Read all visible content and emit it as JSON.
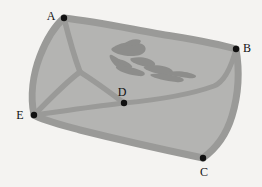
{
  "figure": {
    "name": "region-map-diagram",
    "width": 262,
    "height": 187,
    "background_color": "#f4f3f1",
    "fill_color": "#b4b4b2",
    "border_color": "#9a9a98",
    "edge_color": "#9a9a98",
    "blob_color": "#8d8d8b",
    "node_color": "#111111"
  },
  "vertices": [
    {
      "id": "A",
      "label": "A",
      "x": 64,
      "y": 18,
      "label_x": 51,
      "label_y": 16
    },
    {
      "id": "B",
      "label": "B",
      "x": 236,
      "y": 49,
      "label_x": 245,
      "label_y": 47
    },
    {
      "id": "C",
      "label": "C",
      "x": 203,
      "y": 158,
      "label_x": 202,
      "label_y": 175
    },
    {
      "id": "D",
      "label": "D",
      "x": 124,
      "y": 103,
      "label_x": 121,
      "label_y": 95
    },
    {
      "id": "E",
      "label": "E",
      "x": 34,
      "y": 115,
      "label_x": 19,
      "label_y": 118
    }
  ],
  "edges": [
    {
      "from": "A",
      "to": "B",
      "kind": "boundary"
    },
    {
      "from": "B",
      "to": "C",
      "kind": "boundary"
    },
    {
      "from": "C",
      "to": "E",
      "kind": "boundary"
    },
    {
      "from": "E",
      "to": "A",
      "kind": "boundary"
    },
    {
      "from": "A",
      "to": "D",
      "kind": "interior"
    },
    {
      "from": "E",
      "to": "D",
      "kind": "interior"
    },
    {
      "from": "D",
      "to": "B",
      "kind": "interior"
    },
    {
      "from": "A",
      "to": "E",
      "kind": "interior-branch"
    }
  ],
  "interior_feature": {
    "name": "interior-blob",
    "description": "irregular shaded region inside the map"
  }
}
